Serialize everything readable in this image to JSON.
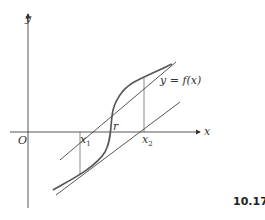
{
  "figure": {
    "number": "10.17",
    "axes": {
      "x_label": "x",
      "y_label": "y",
      "origin_label": "O"
    },
    "curve_label": {
      "lhs": "y",
      "eq": " = ",
      "fn": "f(x)"
    },
    "points": {
      "x1_base": "x",
      "x1_sub": "1",
      "x2_base": "x",
      "x2_sub": "2",
      "root": "r"
    },
    "colors": {
      "curve": "#555555",
      "lines": "#444444",
      "axes": "#444444"
    }
  }
}
